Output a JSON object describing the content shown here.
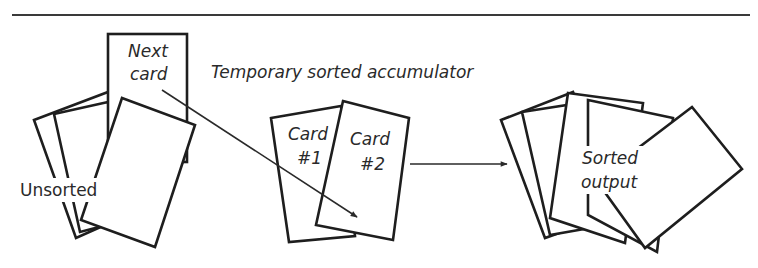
{
  "diagram": {
    "type": "process-illustration",
    "colors": {
      "line": "#1e1e1e",
      "text": "#2a2a2a",
      "background": "#ffffff"
    },
    "labels": {
      "next_card_line1": "Next",
      "next_card_line2": "card",
      "unsorted": "Unsorted",
      "accumulator": "Temporary sorted accumulator",
      "card1_line1": "Card",
      "card1_line2": "#1",
      "card2_line1": "Card",
      "card2_line2": "#2",
      "sorted_line1": "Sorted",
      "sorted_line2": "output"
    },
    "nodes": [
      {
        "id": "unsorted-pile",
        "label": "Unsorted"
      },
      {
        "id": "next-card",
        "label": "Next card"
      },
      {
        "id": "accumulator",
        "label": "Temporary sorted accumulator",
        "cards": [
          "Card #1",
          "Card #2"
        ]
      },
      {
        "id": "sorted-output",
        "label": "Sorted output"
      }
    ],
    "edges": [
      {
        "from": "next-card",
        "to": "accumulator"
      },
      {
        "from": "accumulator",
        "to": "sorted-output"
      }
    ]
  }
}
